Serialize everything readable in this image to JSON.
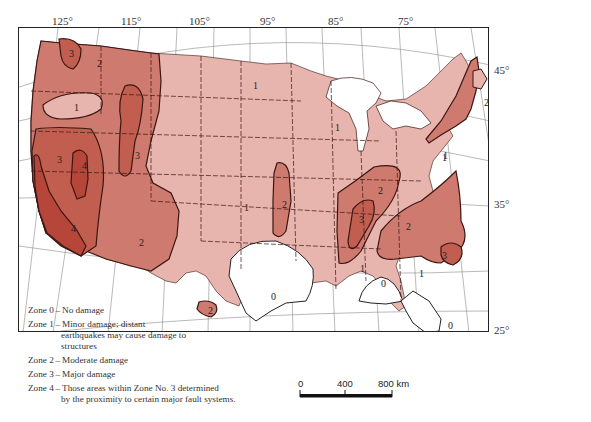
{
  "colors": {
    "zone0": "#ffffff",
    "zone1": "#e8b4ae",
    "zone2": "#cf7a6e",
    "zone3": "#c25e50",
    "zone4": "#b7463a",
    "boundary": "#3a1612",
    "graticule": "#777777"
  },
  "longitude_labels": [
    "125°",
    "115°",
    "105°",
    "95°",
    "85°",
    "75°"
  ],
  "latitude_labels": [
    "45°",
    "35°",
    "25°"
  ],
  "zone_labels": {
    "wa_3": "3",
    "nw_2": "2",
    "or_1": "1",
    "ca_3": "3",
    "ca_4a": "4",
    "ca_4b": "4",
    "ca_3_arrow": "3",
    "nv_3": "3",
    "ut_3": "3",
    "az_2": "2",
    "tx_2": "2",
    "tx_0": "0",
    "gulf_0": "0",
    "fl_0": "0",
    "nd_1": "1",
    "wi_1": "1",
    "mid_1": "1",
    "ks_2": "2",
    "nm_2": "2",
    "mo_2": "2",
    "mo_3": "3",
    "sc_2": "2",
    "sc_3": "3",
    "ms_1": "1",
    "ga_1": "1",
    "oh_1": "1",
    "pa_1": "1",
    "me_1": "1",
    "ny_1": "1",
    "ne_2": "2",
    "ma_3": "3",
    "nw_1b": "1"
  },
  "legend": [
    {
      "zone": "Zone 0",
      "desc": "No damage"
    },
    {
      "zone": "Zone 1",
      "desc": "Minor damage; distant",
      "cont": [
        "earthquakes may cause damage to",
        "structures"
      ]
    },
    {
      "zone": "Zone 2",
      "desc": "Moderate damage"
    },
    {
      "zone": "Zone 3",
      "desc": "Major damage"
    },
    {
      "zone": "Zone 4",
      "desc": "Those areas within Zone No. 3 determined",
      "cont": [
        "by the proximity to certain major fault systems."
      ]
    }
  ],
  "scale_bar": {
    "labels": [
      "0",
      "400",
      "800 km"
    ]
  }
}
